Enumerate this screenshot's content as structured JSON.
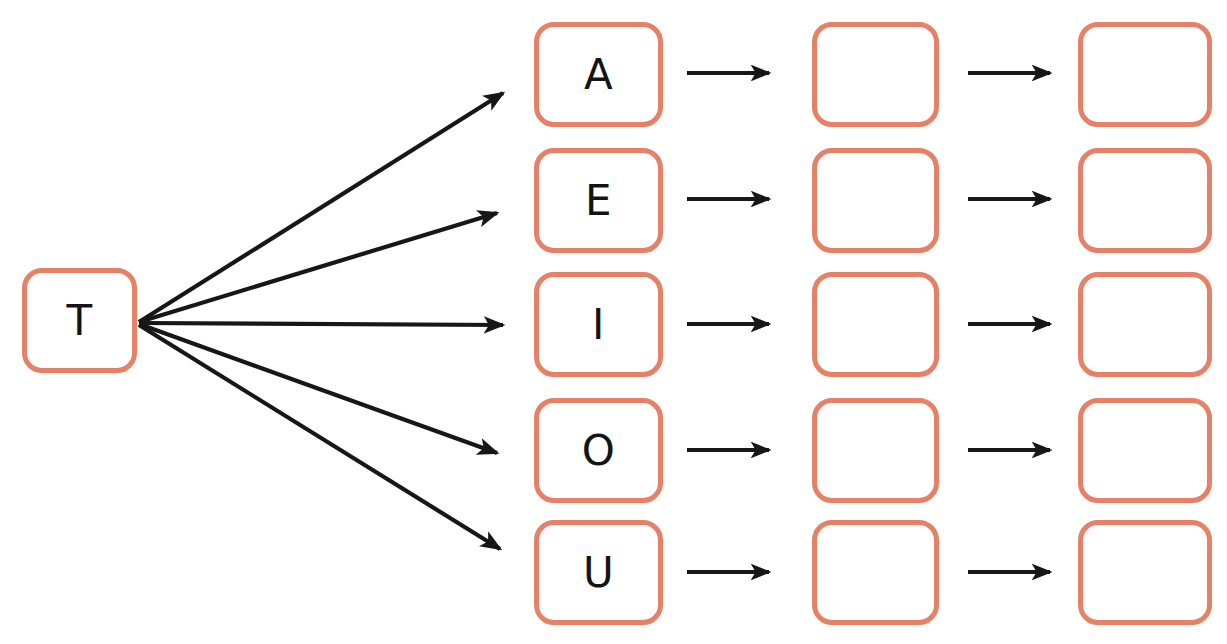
{
  "diagram": {
    "background_color": "#ffffff",
    "box_border_color": "#e58167",
    "arrow_color": "#17171a",
    "source_node": {
      "label": "T",
      "name": "consonant-box-t"
    },
    "columns": [
      {
        "name": "vowel-column",
        "index": 1,
        "filled": true
      },
      {
        "name": "blank-column-2",
        "index": 2,
        "filled": false
      },
      {
        "name": "blank-column-3",
        "index": 3,
        "filled": false
      }
    ],
    "rows": [
      {
        "index": 1,
        "vowel": "A",
        "col2": "",
        "col3": ""
      },
      {
        "index": 2,
        "vowel": "E",
        "col2": "",
        "col3": ""
      },
      {
        "index": 3,
        "vowel": "I",
        "col2": "",
        "col3": ""
      },
      {
        "index": 4,
        "vowel": "O",
        "col2": "",
        "col3": ""
      },
      {
        "index": 5,
        "vowel": "U",
        "col2": "",
        "col3": ""
      }
    ],
    "fan_arrows": {
      "name": "branch-arrow",
      "count": 5,
      "origin_label": "T"
    },
    "row_arrows": {
      "name": "flow-arrow",
      "count_per_row": 2
    }
  }
}
